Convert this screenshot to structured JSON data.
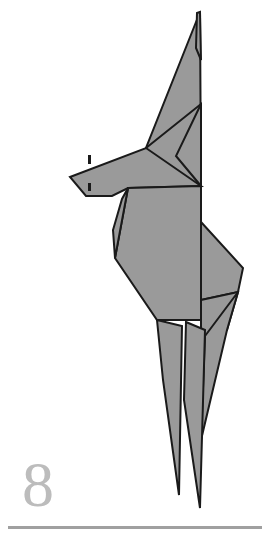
{
  "page": {
    "number": "8",
    "background_color": "#ffffff",
    "width": 267,
    "height": 553
  },
  "footer": {
    "rule_color": "#a0a0a0",
    "page_number_color": "#bcbcbc"
  },
  "figure": {
    "name": "origami-bird",
    "fill_color": "#9a9a9a",
    "stroke_color": "#1a1a1a",
    "stroke_width": "2",
    "parts": [
      {
        "name": "upper-wing",
        "label": "Upper raised wing"
      },
      {
        "name": "head-and-beak",
        "label": "Head with pointed beak"
      },
      {
        "name": "body",
        "label": "Body panel"
      },
      {
        "name": "rear-wing-flap",
        "label": "Rear wing flap"
      },
      {
        "name": "tail-point-left",
        "label": "Left tail point"
      },
      {
        "name": "tail-point-right",
        "label": "Right tail point"
      }
    ],
    "markers": [
      {
        "name": "beak-reference-tick-upper",
        "label": "Reference tick above beak"
      },
      {
        "name": "beak-reference-tick-lower",
        "label": "Reference tick below beak"
      }
    ]
  }
}
